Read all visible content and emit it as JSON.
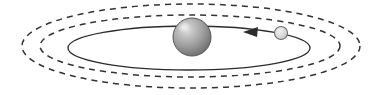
{
  "canvas": {
    "width": 383,
    "height": 95,
    "background": "#ffffff",
    "title": "Orbital system diagram"
  },
  "colors": {
    "stroke": "#2b2b2b",
    "dashed_stroke": "#333333",
    "central_body_light": "#d8d8d8",
    "central_body_mid": "#9a9a9a",
    "central_body_dark": "#6b6b6b",
    "central_body_edge": "#555555",
    "satellite_light": "#e8e8e8",
    "satellite_mid": "#cfcfcf",
    "satellite_edge": "#6e6e6e",
    "arrow_fill": "#2b2b2b"
  },
  "diagram": {
    "type": "orbital-system",
    "central_body": {
      "name": "central-sphere",
      "cx": 192,
      "cy": 37,
      "r": 19,
      "shading": "3d-gradient",
      "highlight_offset": "upper-left"
    },
    "satellite": {
      "name": "satellite-sphere",
      "cx": 281,
      "cy": 33,
      "r": 6.5,
      "shading": "light-gradient"
    },
    "solid_orbit": {
      "name": "solid-orbit-ellipse",
      "cx": 189,
      "cy": 48,
      "rx": 121,
      "ry": 22,
      "style": "solid",
      "stroke_width": 1.3
    },
    "dashed_orbits": [
      {
        "name": "inner-dashed-ellipse",
        "cx": 190,
        "cy": 46,
        "rx": 150,
        "ry": 31,
        "style": "dashed",
        "dash_pattern": "6 5",
        "stroke_width": 1.5
      },
      {
        "name": "outer-dashed-ellipse",
        "cx": 191,
        "cy": 46,
        "rx": 169,
        "ry": 42,
        "style": "dashed",
        "dash_pattern": "6 5",
        "stroke_width": 1.5
      }
    ],
    "direction_arrow": {
      "name": "orbit-direction-arrow",
      "points": "243,32 258,27 257,37",
      "direction": "left",
      "meaning": "counterclockwise orbital motion"
    }
  }
}
